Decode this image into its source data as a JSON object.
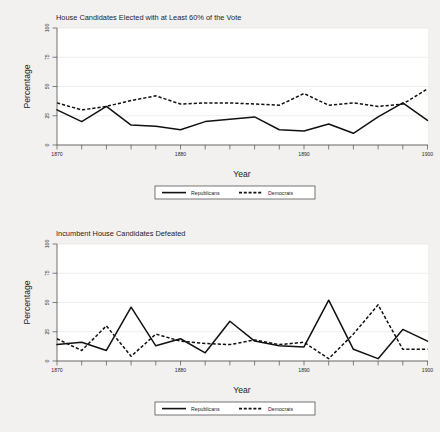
{
  "figure": {
    "background_color": "#f3f1f0",
    "plot_background_color": "#ffffff",
    "line_color": "#111111",
    "grid_color": "#e3e1e0",
    "axis_color": "#4d4d4d"
  },
  "panels": [
    {
      "id": "top",
      "title": "House Candidates Elected with at Least 60% of the Vote",
      "xlabel": "Year",
      "ylabel": "Percentage",
      "ytick_labels": [
        "0",
        "25",
        "50",
        "75",
        "100"
      ],
      "xtick_labels": [
        "1870",
        "1880",
        "1890",
        "1900"
      ],
      "legend": [
        {
          "label": "Republicans",
          "style": "solid"
        },
        {
          "label": "Democrats",
          "style": "dashed"
        }
      ]
    },
    {
      "id": "bottom",
      "title": "Incumbent House Candidates Defeated",
      "xlabel": "Year",
      "ylabel": "Percentage",
      "ytick_labels": [
        "0",
        "25",
        "50",
        "75",
        "100"
      ],
      "xtick_labels": [
        "1870",
        "1880",
        "1890",
        "1900"
      ],
      "legend": [
        {
          "label": "Republicans",
          "style": "solid"
        },
        {
          "label": "Democrats",
          "style": "dashed"
        }
      ]
    }
  ],
  "chart_data": [
    {
      "type": "line",
      "title": "House Candidates Elected with at Least 60% of the Vote",
      "xlabel": "Year",
      "ylabel": "Percentage",
      "xlim": [
        1870,
        1900
      ],
      "ylim": [
        0,
        100
      ],
      "yticks": [
        0,
        25,
        50,
        75,
        100
      ],
      "xticks": [
        1870,
        1880,
        1890,
        1900
      ],
      "xticks_minor_step": 2,
      "grid": true,
      "legend_position": "below-outside",
      "x": [
        1870,
        1872,
        1874,
        1876,
        1878,
        1880,
        1882,
        1884,
        1886,
        1888,
        1890,
        1892,
        1894,
        1896,
        1898,
        1900
      ],
      "series": [
        {
          "name": "Republicans",
          "style": "solid",
          "values": [
            30,
            20,
            33,
            17,
            16,
            13,
            20,
            22,
            24,
            13,
            12,
            18,
            10,
            24,
            36,
            21
          ]
        },
        {
          "name": "Democrats",
          "style": "dashed",
          "values": [
            36,
            30,
            33,
            38,
            42,
            35,
            36,
            36,
            35,
            34,
            44,
            34,
            36,
            33,
            35,
            48
          ]
        }
      ]
    },
    {
      "type": "line",
      "title": "Incumbent House Candidates Defeated",
      "xlabel": "Year",
      "ylabel": "Percentage",
      "xlim": [
        1870,
        1900
      ],
      "ylim": [
        0,
        100
      ],
      "yticks": [
        0,
        25,
        50,
        75,
        100
      ],
      "xticks": [
        1870,
        1880,
        1890,
        1900
      ],
      "xticks_minor_step": 2,
      "grid": true,
      "legend_position": "below-outside",
      "x": [
        1870,
        1872,
        1874,
        1876,
        1878,
        1880,
        1882,
        1884,
        1886,
        1888,
        1890,
        1892,
        1894,
        1896,
        1898,
        1900
      ],
      "series": [
        {
          "name": "Republicans",
          "style": "solid",
          "values": [
            14,
            16,
            9,
            46,
            13,
            19,
            7,
            34,
            17,
            13,
            12,
            52,
            10,
            2,
            27,
            17
          ]
        },
        {
          "name": "Democrats",
          "style": "dashed",
          "values": [
            19,
            9,
            30,
            4,
            23,
            17,
            15,
            14,
            18,
            14,
            16,
            2,
            23,
            48,
            10,
            10
          ]
        }
      ]
    }
  ]
}
